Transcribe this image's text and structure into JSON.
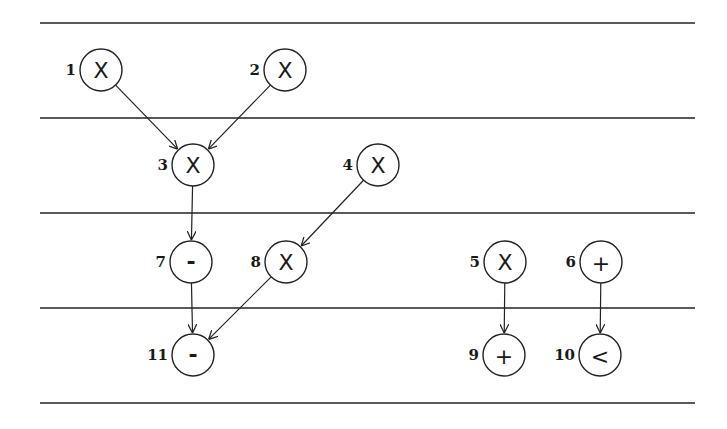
{
  "diagram": {
    "type": "dataflow-schedule",
    "lanes_y": [
      23,
      118,
      213,
      308,
      403
    ],
    "lane_x_start": 40,
    "lane_x_end": 695,
    "node_radius": 21,
    "nodes": [
      {
        "id": "1",
        "op": "X",
        "x": 101,
        "y": 70,
        "step": 1
      },
      {
        "id": "2",
        "op": "X",
        "x": 285,
        "y": 70,
        "step": 1
      },
      {
        "id": "3",
        "op": "X",
        "x": 193,
        "y": 165,
        "step": 2
      },
      {
        "id": "4",
        "op": "X",
        "x": 378,
        "y": 165,
        "step": 2
      },
      {
        "id": "7",
        "op": "-",
        "x": 191,
        "y": 262,
        "step": 3
      },
      {
        "id": "8",
        "op": "X",
        "x": 286,
        "y": 262,
        "step": 3
      },
      {
        "id": "5",
        "op": "X",
        "x": 505,
        "y": 262,
        "step": 3
      },
      {
        "id": "6",
        "op": "+",
        "x": 601,
        "y": 262,
        "step": 3
      },
      {
        "id": "11",
        "op": "-",
        "x": 193,
        "y": 355,
        "step": 4
      },
      {
        "id": "9",
        "op": "+",
        "x": 504,
        "y": 355,
        "step": 4
      },
      {
        "id": "10",
        "op": "<",
        "x": 600,
        "y": 355,
        "step": 4
      }
    ],
    "edges": [
      {
        "from": "1",
        "to": "3"
      },
      {
        "from": "2",
        "to": "3"
      },
      {
        "from": "3",
        "to": "7"
      },
      {
        "from": "4",
        "to": "8"
      },
      {
        "from": "7",
        "to": "11"
      },
      {
        "from": "8",
        "to": "11"
      },
      {
        "from": "5",
        "to": "9"
      },
      {
        "from": "6",
        "to": "10"
      }
    ]
  }
}
